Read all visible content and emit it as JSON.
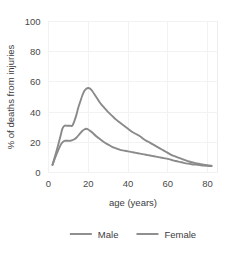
{
  "chart_data": {
    "type": "line",
    "title": "",
    "xlabel": "age (years)",
    "ylabel": "% of deaths from injuries",
    "xlim": [
      0,
      85
    ],
    "ylim": [
      0,
      100
    ],
    "xticks": [
      "0",
      "20",
      "40",
      "60",
      "80"
    ],
    "xtick_values": [
      0,
      20,
      40,
      60,
      80
    ],
    "yticks": [
      "0",
      "20",
      "40",
      "60",
      "80",
      "100"
    ],
    "ytick_values": [
      0,
      20,
      40,
      60,
      80,
      100
    ],
    "grid": true,
    "legend_position": "bottom",
    "x": [
      2,
      4,
      6,
      7,
      8,
      9,
      10,
      11,
      12,
      13,
      14,
      15,
      16,
      17,
      18,
      19,
      20,
      21,
      22,
      24,
      26,
      28,
      30,
      32,
      34,
      36,
      38,
      40,
      42,
      44,
      46,
      48,
      50,
      52,
      54,
      56,
      58,
      60,
      62,
      64,
      66,
      68,
      70,
      72,
      74,
      76,
      78,
      80,
      82
    ],
    "series": [
      {
        "name": "Male",
        "color": "#8a8a8a",
        "values": [
          5,
          14,
          24,
          29,
          31,
          31,
          31,
          31,
          31,
          34,
          38,
          43,
          47,
          51,
          54,
          55.5,
          56,
          55.5,
          54,
          50,
          46,
          43,
          40,
          37.5,
          35,
          33,
          31,
          29,
          27,
          25.5,
          24,
          22,
          20.5,
          19,
          17.5,
          16,
          14.5,
          13,
          11.5,
          10.5,
          9.5,
          8.5,
          7.5,
          6.8,
          6.2,
          5.6,
          5.2,
          4.8,
          4.5
        ]
      },
      {
        "name": "Female",
        "color": "#8a8a8a",
        "values": [
          5,
          12,
          18,
          20,
          21,
          21,
          21,
          21,
          21.5,
          22,
          23,
          24.5,
          26,
          27.5,
          28.5,
          29,
          28.5,
          27.5,
          26.5,
          24,
          22,
          20,
          18.5,
          17,
          16,
          15,
          14.5,
          14,
          13.5,
          13,
          12.5,
          12,
          11.5,
          11,
          10.5,
          10,
          9.5,
          9,
          8.3,
          7.6,
          7,
          6.4,
          5.9,
          5.5,
          5.2,
          4.9,
          4.6,
          4.4,
          4.2
        ]
      }
    ]
  },
  "legend": {
    "items": [
      {
        "label": "Male",
        "color": "#8a8a8a"
      },
      {
        "label": "Female",
        "color": "#8a8a8a"
      }
    ]
  },
  "colors": {
    "male": "#8a8a8a",
    "female": "#8a8a8a",
    "grid": "#f2f2f2",
    "frame": "#ededed",
    "text": "#3c3c3c",
    "background": "#ffffff"
  }
}
